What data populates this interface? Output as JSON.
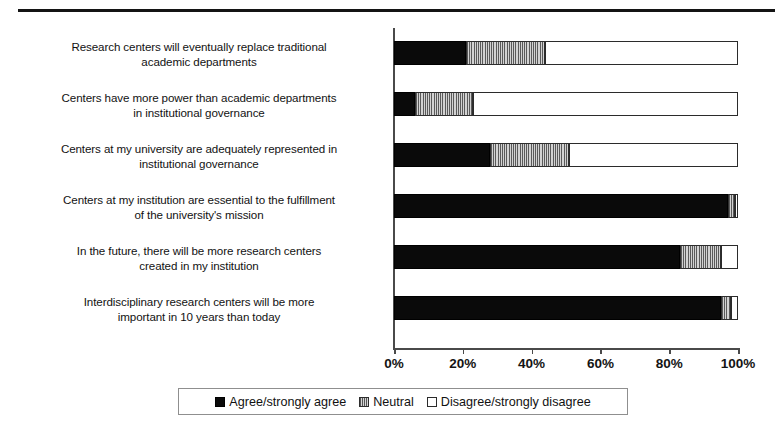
{
  "figure": {
    "has_top_rule": true,
    "background": "#ffffff"
  },
  "chart_data": {
    "type": "bar",
    "orientation": "horizontal",
    "stacked": true,
    "stack_mode": "percent",
    "title": "",
    "subtitle": "",
    "xlabel": "",
    "ylabel": "",
    "xlim": [
      0,
      100
    ],
    "grid": false,
    "legend_position": "bottom",
    "axis_tick_labels": [
      "0%",
      "20%",
      "40%",
      "60%",
      "80%",
      "100%"
    ],
    "axis_tick_values": [
      0,
      20,
      40,
      60,
      80,
      100
    ],
    "categories": [
      "Research centers will eventually replace traditional academic departments",
      "Centers have more power than academic departments in institutional governance",
      "Centers at my university are adequately represented in institutional governance",
      "Centers at my institution are essential to the fulfillment of the university's mission",
      "In the future, there will be more research centers created in my institution",
      "Interdisciplinary research centers will be more important in 10 years than today"
    ],
    "category_lines": [
      [
        "Research centers will eventually replace traditional",
        "academic departments"
      ],
      [
        "Centers have more power than academic departments",
        "in institutional governance"
      ],
      [
        "Centers at my university are adequately represented in",
        "institutional governance"
      ],
      [
        "Centers at my institution are essential to the fulfillment",
        "of the university's mission"
      ],
      [
        "In the future, there will be more research centers",
        "created in my institution"
      ],
      [
        "Interdisciplinary research centers will be more",
        "important in 10 years than today"
      ]
    ],
    "series": [
      {
        "name": "Agree/strongly agree",
        "color": "#0a0a0a",
        "pattern": "solid",
        "values": [
          21,
          6,
          28,
          97,
          83,
          95
        ]
      },
      {
        "name": "Neutral",
        "color": "#9a9a9a",
        "pattern": "vertical-hatch",
        "values": [
          23,
          17,
          23,
          2,
          12,
          3
        ]
      },
      {
        "name": "Disagree/strongly disagree",
        "color": "#ffffff",
        "pattern": "outline",
        "values": [
          56,
          77,
          49,
          1,
          5,
          2
        ]
      }
    ]
  },
  "legend": {
    "items": [
      {
        "label": "Agree/strongly agree",
        "swatch": "agree-swatch-icon"
      },
      {
        "label": "Neutral",
        "swatch": "neutral-swatch-icon"
      },
      {
        "label": "Disagree/strongly disagree",
        "swatch": "disagree-swatch-icon"
      }
    ]
  }
}
